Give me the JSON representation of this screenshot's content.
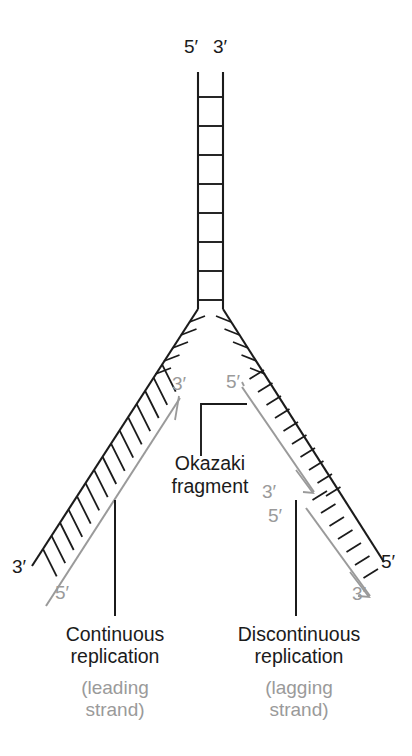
{
  "figure": {
    "type": "biology-diagram",
    "colors": {
      "template_strand": "#1b1b1b",
      "new_strand": "#9a9a9a",
      "caption_main": "#1b1b1b",
      "caption_sub": "#9a9a9a",
      "background": "#ffffff"
    }
  },
  "top_clipped_text": " ",
  "parent_duplex": {
    "left_end_label": "5′",
    "right_end_label": "3′",
    "rungs": 8
  },
  "leading_strand": {
    "template_end_label": "3′",
    "new_strand_start_label": "3′",
    "new_strand_end_label": "5′",
    "rungs": 15,
    "caption_line1": "Continuous",
    "caption_line2": "replication",
    "sub_line1": "(leading",
    "sub_line2": "strand)"
  },
  "lagging_strand": {
    "template_end_label": "5′",
    "fragment1_start_label": "5′",
    "fragment1_end_label": "3′",
    "fragment2_start_label": "5′",
    "fragment2_end_label": "3′",
    "template_far_label": "5′",
    "rungs_fragment1": 10,
    "rungs_fragment2": 9,
    "caption_line1": "Discontinuous",
    "caption_line2": "replication",
    "sub_line1": "(lagging",
    "sub_line2": "strand)"
  },
  "okazaki_annotation": {
    "line1": "Okazaki",
    "line2": "fragment"
  }
}
